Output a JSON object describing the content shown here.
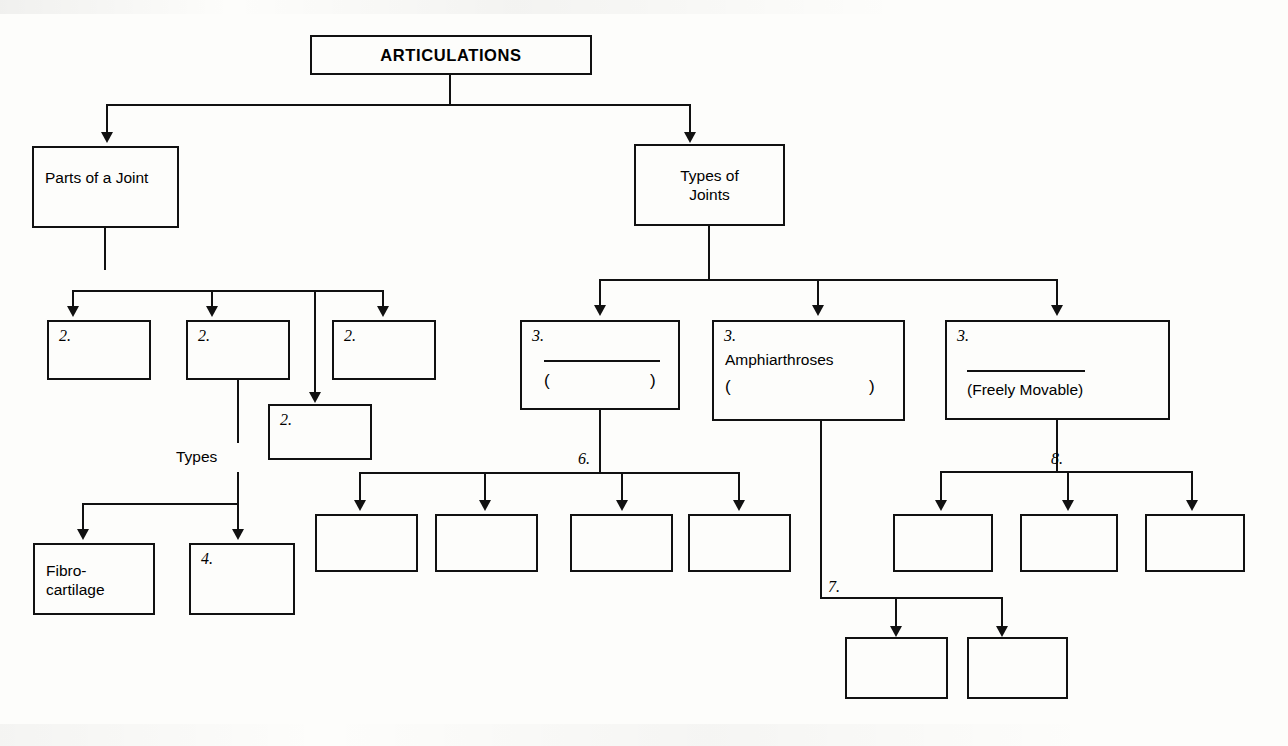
{
  "diagram": {
    "title": "ARTICULATIONS",
    "root": {
      "label": "ARTICULATIONS"
    },
    "branches": {
      "left": {
        "label": "Parts of a\nJoint"
      },
      "right": {
        "label": "Types of\nJoints"
      }
    },
    "parts_of_joint_blanks": [
      {
        "number": "2.",
        "label": ""
      },
      {
        "number": "2.",
        "label": ""
      },
      {
        "number": "2.",
        "label": ""
      },
      {
        "number": "2.",
        "label": ""
      }
    ],
    "types_sub_label": "Types",
    "types_children": [
      {
        "number": "",
        "label": "Fibro-\ncartilage"
      },
      {
        "number": "4.",
        "label": ""
      }
    ],
    "joint_types": [
      {
        "number": "3.",
        "name": "",
        "name_is_blank": true,
        "paren_open": "(",
        "paren_close": ")",
        "paren_text": ""
      },
      {
        "number": "3.",
        "name": "Amphiarthroses",
        "name_is_blank": false,
        "paren_open": "(",
        "paren_close": ")",
        "paren_text": ""
      },
      {
        "number": "3.",
        "name": "",
        "name_is_blank": true,
        "paren_open": "",
        "paren_close": "",
        "paren_text": "(Freely Movable)"
      }
    ],
    "markers": {
      "synarthroses_children": "6.",
      "amphiarthroses_children": "7.",
      "diarthroses_children": "8."
    },
    "blank_box_groups": {
      "group_6": [
        "",
        "",
        "",
        ""
      ],
      "group_8": [
        "",
        "",
        ""
      ],
      "group_7": [
        "",
        ""
      ]
    },
    "colors": {
      "ink": "#111111",
      "paper": "#fdfdfb"
    }
  }
}
